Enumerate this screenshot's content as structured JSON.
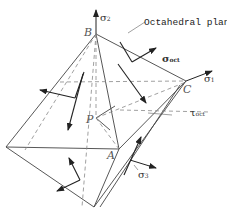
{
  "diagram": {
    "title": "Octahedral plane",
    "vertices": {
      "A": "A",
      "B": "B",
      "C": "C",
      "P": "P"
    },
    "axes": {
      "sigma1": {
        "symbol": "σ",
        "sub": "1"
      },
      "sigma2": {
        "symbol": "σ",
        "sub": "2"
      },
      "sigma3": {
        "symbol": "σ",
        "sub": "3"
      }
    },
    "stresses": {
      "normal": {
        "symbol": "σ",
        "sub": "oct"
      },
      "shear": {
        "symbol": "τ",
        "sub": "oct"
      }
    },
    "colors": {
      "line": "#333333",
      "dashed": "#888888",
      "background": "#ffffff"
    }
  }
}
